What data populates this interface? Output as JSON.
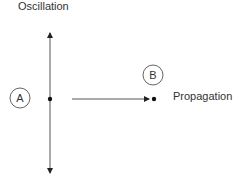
{
  "diagram": {
    "labels": {
      "oscillation": "Oscillation",
      "propagation": "Propagation"
    },
    "points": [
      {
        "id": "A",
        "label": "A"
      },
      {
        "id": "B",
        "label": "B"
      }
    ],
    "colors": {
      "line": "#222222",
      "circle": "#555555",
      "text": "#333333"
    }
  }
}
